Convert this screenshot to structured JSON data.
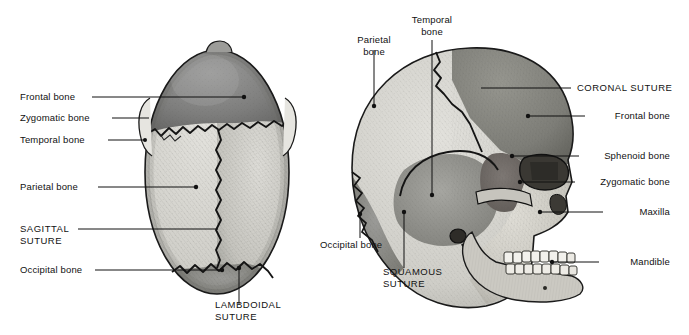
{
  "figure": {
    "views": [
      {
        "name": "superior-view",
        "description": "Top view of the cranium"
      },
      {
        "name": "lateral-view",
        "description": "Side view of the skull"
      }
    ],
    "ink_color": "#111111",
    "background_color": "#ffffff"
  },
  "labels": {
    "left": [
      {
        "id": "frontal-bone",
        "text": "Frontal bone"
      },
      {
        "id": "zygomatic-bone",
        "text": "Zygomatic bone"
      },
      {
        "id": "temporal-bone",
        "text": "Temporal bone"
      },
      {
        "id": "parietal-bone",
        "text": "Parietal bone"
      },
      {
        "id": "sagittal-suture",
        "line1": "SAGITTAL",
        "line2": "SUTURE"
      },
      {
        "id": "occipital-bone",
        "text": "Occipital bone"
      }
    ],
    "right": [
      {
        "id": "coronal-suture",
        "text": "CORONAL SUTURE"
      },
      {
        "id": "frontal-bone",
        "text": "Frontal bone"
      },
      {
        "id": "sphenoid-bone",
        "text": "Sphenoid bone"
      },
      {
        "id": "zygomatic-bone",
        "text": "Zygomatic bone"
      },
      {
        "id": "maxilla",
        "text": "Maxilla"
      },
      {
        "id": "mandible",
        "text": "Mandible"
      }
    ],
    "top": [
      {
        "id": "parietal-bone",
        "line1": "Parietal",
        "line2": "bone"
      },
      {
        "id": "temporal-bone",
        "line1": "Temporal",
        "line2": "bone"
      }
    ],
    "bottom": [
      {
        "id": "lambdoidal-suture",
        "line1": "LAMBDOIDAL",
        "line2": "SUTURE"
      },
      {
        "id": "occipital-bone",
        "text": "Occipital bone"
      },
      {
        "id": "squamous-suture",
        "line1": "SQUAMOUS",
        "line2": "SUTURE"
      }
    ]
  },
  "bone_shades": {
    "frontal_dark": "#7d7d7d",
    "parietal_light": "#d2d2cd",
    "occipital_mid": "#8f8f8f",
    "temporal_mid": "#9a9a96",
    "sphenoid_dark": "#6e6a68",
    "face_light": "#cfcdc6",
    "teeth": "#f2f1ec",
    "outline": "#1a1a1a"
  }
}
